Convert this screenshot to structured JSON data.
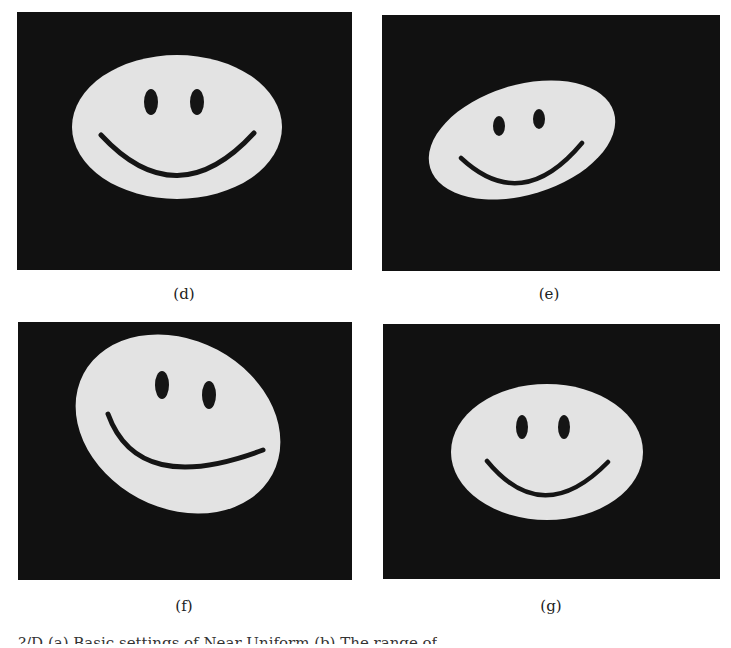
{
  "figure": {
    "panels": [
      {
        "id": "d",
        "label": "(d)",
        "description": "Smiley face ellipse, horizontal orientation"
      },
      {
        "id": "e",
        "label": "(e)",
        "description": "Smiley face ellipse, rotated counter-clockwise, smaller"
      },
      {
        "id": "f",
        "label": "(f)",
        "description": "Smiley face ellipse, rotated clockwise, larger"
      },
      {
        "id": "g",
        "label": "(g)",
        "description": "Smiley face ellipse, horizontal orientation, smaller"
      }
    ],
    "colors": {
      "background": "#111111",
      "face": "#e3e3e3",
      "features": "#151515"
    },
    "bottom_text": "?/D (a) Basic settings of Near Uniform        (b) The range of"
  }
}
